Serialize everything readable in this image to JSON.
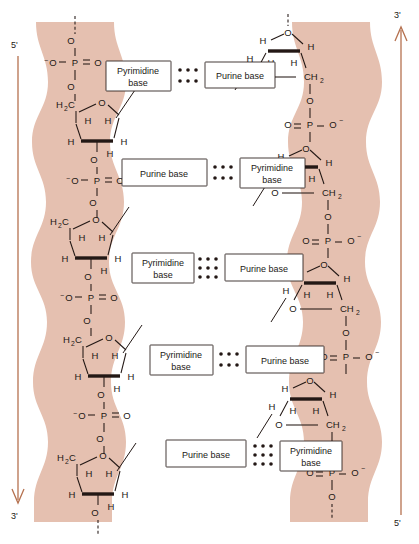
{
  "figure": {
    "ribbon_color": "#e5c0b0",
    "arrow_color": "#b5714f",
    "ink_color": "#231815"
  },
  "strand_labels": {
    "left_top": "5'",
    "left_bottom": "3'",
    "right_top": "3'",
    "right_bottom": "5'"
  },
  "arrows": [
    {
      "name": "left-strand-arrow",
      "direction": "down",
      "from": "5'",
      "to": "3'"
    },
    {
      "name": "right-strand-arrow",
      "direction": "up",
      "from": "5'",
      "to": "3'"
    }
  ],
  "base_pairs": [
    {
      "index": 1,
      "left": "Pyrimidine base",
      "right": "Purine base",
      "hbonds": 2
    },
    {
      "index": 2,
      "left": "Purine base",
      "right": "Pyrimidine base",
      "hbonds": 2
    },
    {
      "index": 3,
      "left": "Pyrimidine base",
      "right": "Purine base",
      "hbonds": 3
    },
    {
      "index": 4,
      "left": "Pyrimidine base",
      "right": "Purine base",
      "hbonds": 2
    },
    {
      "index": 5,
      "left": "Purine base",
      "right": "Pyrimidine base",
      "hbonds": 3
    }
  ],
  "atoms": {
    "oxygen": "O",
    "phosphorus": "P",
    "hydrogen": "H",
    "carbon": "C",
    "methylene": "CH",
    "methylene_sub": "2",
    "h2c_h": "H",
    "h2c_sub": "2",
    "h2c_c": "C",
    "minus": "−",
    "oxygen_anion_pre": "O",
    "oxygen_anion_post": "O"
  },
  "chemistry": {
    "left_backbone_order": [
      "O",
      "⁻O—P=O",
      "O",
      "H₂C",
      "deoxyribose",
      "O"
    ],
    "right_backbone_order": [
      "deoxyribose",
      "CH₂",
      "O",
      "O=P—O⁻",
      "O"
    ],
    "sugar_name": "deoxyribose",
    "sugar_ring_hydrogens": [
      "H",
      "H",
      "H",
      "H",
      "H"
    ],
    "phosphate_label": "P"
  }
}
